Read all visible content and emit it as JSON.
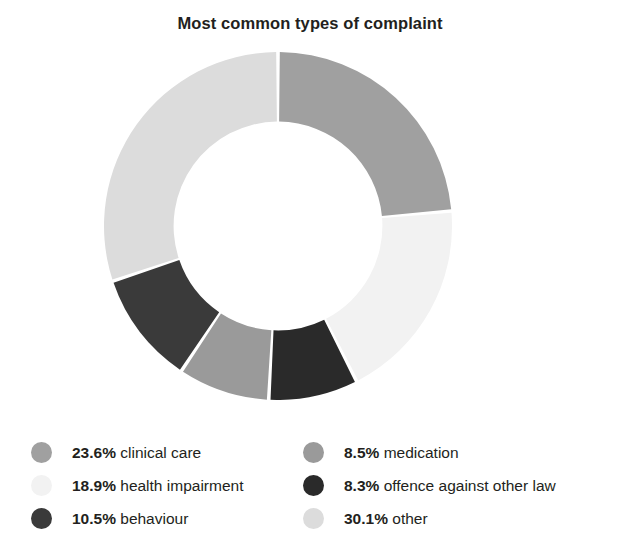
{
  "title": "Most common types of complaint",
  "chart_data": {
    "type": "pie",
    "variant": "donut",
    "title": "Most common types of complaint",
    "xlabel": "",
    "ylabel": "",
    "units": "percent",
    "start_angle_deg": 0,
    "direction": "clockwise",
    "inner_radius_ratio": 0.6,
    "gap_deg": 1.2,
    "legend_position": "bottom",
    "grid": false,
    "categories": [
      "clinical care",
      "health impairment",
      "offence against other law",
      "medication",
      "behaviour",
      "other"
    ],
    "values": [
      23.6,
      18.9,
      8.3,
      8.5,
      10.5,
      30.1
    ],
    "colors": [
      "#a0a0a0",
      "#f2f2f2",
      "#2a2a2a",
      "#9a9a9a",
      "#3a3a3a",
      "#dcdcdc"
    ],
    "slices": [
      {
        "label": "clinical care",
        "value": 23.6,
        "display": "23.6%",
        "color": "#a0a0a0"
      },
      {
        "label": "health impairment",
        "value": 18.9,
        "display": "18.9%",
        "color": "#f2f2f2"
      },
      {
        "label": "offence against other law",
        "value": 8.3,
        "display": "8.3%",
        "color": "#2a2a2a"
      },
      {
        "label": "medication",
        "value": 8.5,
        "display": "8.5%",
        "color": "#9a9a9a"
      },
      {
        "label": "behaviour",
        "value": 10.5,
        "display": "10.5%",
        "color": "#3a3a3a"
      },
      {
        "label": "other",
        "value": 30.1,
        "display": "30.1%",
        "color": "#dcdcdc"
      }
    ]
  },
  "legend": {
    "left_column": [
      {
        "pct": "23.6%",
        "label": "clinical care",
        "color": "#a0a0a0"
      },
      {
        "pct": "18.9%",
        "label": "health impairment",
        "color": "#f2f2f2"
      },
      {
        "pct": "10.5%",
        "label": "behaviour",
        "color": "#3a3a3a"
      }
    ],
    "right_column": [
      {
        "pct": "8.5%",
        "label": "medication",
        "color": "#9a9a9a"
      },
      {
        "pct": "8.3%",
        "label": "offence against other law",
        "color": "#2a2a2a"
      },
      {
        "pct": "30.1%",
        "label": "other",
        "color": "#dcdcdc"
      }
    ]
  }
}
